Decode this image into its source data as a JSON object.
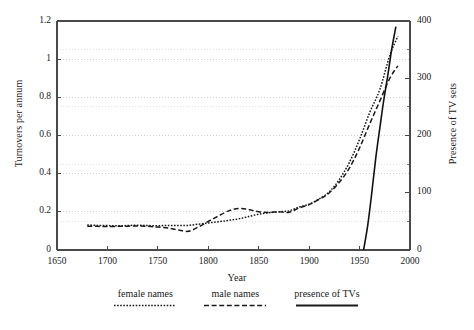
{
  "chart_data": {
    "type": "line",
    "title": "",
    "xlabel": "Year",
    "ylabel": "Turnovers per annum",
    "ylabel_right": "Presence of TV sets",
    "xlim": [
      1650,
      2000
    ],
    "ylim": [
      0,
      1.2
    ],
    "ylim_right": [
      0,
      400
    ],
    "xticks": [
      1650,
      1700,
      1750,
      1800,
      1850,
      1900,
      1950,
      2000
    ],
    "xticklabels": [
      "1650",
      "1700",
      "1750",
      "1800",
      "1850",
      "1900",
      "1950",
      "2000"
    ],
    "yticks": [
      0,
      0.2,
      0.4,
      0.6,
      0.8,
      1,
      1.2
    ],
    "yticklabels": [
      "0",
      "0.2",
      "0.4",
      "0.6",
      "0.8",
      "1",
      "1.2"
    ],
    "yticks_right": [
      0,
      100,
      200,
      300,
      400
    ],
    "yticklabels_right": [
      "0",
      "100",
      "200",
      "300",
      "400"
    ],
    "yminorticks_right": [
      50,
      150,
      250,
      350
    ],
    "grid": true,
    "grid_style": "dotted",
    "grid_color": "#c8c8c8",
    "legend_position": "below",
    "series": [
      {
        "name": "female names",
        "axis": "left",
        "style": "dotted",
        "color": "#1a1a1a",
        "x": [
          1680,
          1690,
          1700,
          1710,
          1720,
          1730,
          1740,
          1750,
          1760,
          1770,
          1780,
          1790,
          1800,
          1810,
          1820,
          1830,
          1840,
          1850,
          1860,
          1870,
          1880,
          1890,
          1900,
          1910,
          1920,
          1930,
          1940,
          1950,
          1960,
          1970,
          1980,
          1988
        ],
        "y": [
          0.131,
          0.129,
          0.128,
          0.127,
          0.128,
          0.13,
          0.128,
          0.127,
          0.129,
          0.128,
          0.129,
          0.135,
          0.142,
          0.148,
          0.155,
          0.163,
          0.175,
          0.188,
          0.195,
          0.2,
          0.205,
          0.225,
          0.24,
          0.268,
          0.305,
          0.37,
          0.46,
          0.58,
          0.72,
          0.84,
          1.02,
          1.12
        ]
      },
      {
        "name": "male names",
        "axis": "left",
        "style": "dashed",
        "color": "#1a1a1a",
        "x": [
          1680,
          1690,
          1700,
          1710,
          1720,
          1730,
          1740,
          1750,
          1760,
          1770,
          1780,
          1790,
          1800,
          1810,
          1820,
          1830,
          1840,
          1850,
          1860,
          1870,
          1880,
          1890,
          1900,
          1910,
          1920,
          1930,
          1940,
          1950,
          1960,
          1970,
          1980,
          1988
        ],
        "y": [
          0.125,
          0.124,
          0.123,
          0.124,
          0.125,
          0.126,
          0.124,
          0.12,
          0.115,
          0.105,
          0.098,
          0.12,
          0.15,
          0.178,
          0.205,
          0.218,
          0.212,
          0.2,
          0.197,
          0.2,
          0.198,
          0.22,
          0.238,
          0.265,
          0.3,
          0.355,
          0.43,
          0.535,
          0.66,
          0.78,
          0.9,
          0.965
        ]
      },
      {
        "name": "presence of TVs",
        "axis": "right",
        "style": "solid",
        "color": "#111111",
        "x": [
          1954,
          1958,
          1962,
          1966,
          1970,
          1974,
          1978,
          1982,
          1986
        ],
        "y": [
          0,
          42,
          98,
          160,
          212,
          262,
          305,
          352,
          390
        ]
      }
    ]
  },
  "legend": {
    "items": [
      {
        "label": "female names",
        "style": "dotted"
      },
      {
        "label": "male names",
        "style": "dashed"
      },
      {
        "label": "presence of TVs",
        "style": "solid"
      }
    ]
  }
}
